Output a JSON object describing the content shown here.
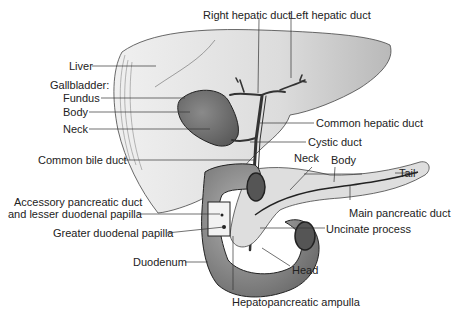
{
  "labels": {
    "right_hepatic_duct": "Right hepatic duct",
    "left_hepatic_duct": "Left hepatic duct",
    "liver": "Liver",
    "gallbladder": "Gallbladder:",
    "fundus": "Fundus",
    "body_gb": "Body",
    "neck_gb": "Neck",
    "common_hepatic_duct": "Common hepatic duct",
    "cystic_duct": "Cystic duct",
    "common_bile_duct": "Common bile duct",
    "neck_pancreas": "Neck",
    "body_pancreas": "Body",
    "tail": "Tail",
    "accessory_line1": "Accessory pancreatic duct",
    "accessory_line2": "and lesser duodenal papilla",
    "main_pancreatic_duct": "Main pancreatic duct",
    "greater_duodenal_papilla": "Greater duodenal papilla",
    "uncinate_process": "Uncinate process",
    "duodenum": "Duodenum",
    "head": "Head",
    "hepatopancreatic_ampulla": "Hepatopancreatic ampulla"
  },
  "colors": {
    "liver": "#e4e4e4",
    "liver_left": "#c9c9c9",
    "gallbladder": "#7a7a7a",
    "pancreas": "#dcdcdc",
    "duodenum": "#9a9a9a",
    "line": "#333333"
  }
}
